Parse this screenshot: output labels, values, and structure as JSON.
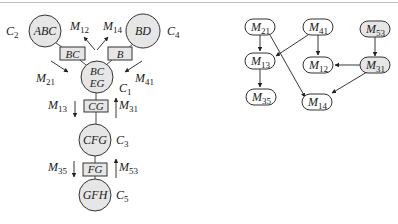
{
  "left_diagram": {
    "clusters": [
      {
        "id": "C2",
        "label": "ABC",
        "name": "C",
        "sub": "2"
      },
      {
        "id": "C4",
        "label": "BD",
        "name": "C",
        "sub": "4"
      },
      {
        "id": "C1",
        "label_line1": "BC",
        "label_line2": "EG",
        "name": "C",
        "sub": "1"
      },
      {
        "id": "C3",
        "label": "CFG",
        "name": "C",
        "sub": "3"
      },
      {
        "id": "C5",
        "label": "GFH",
        "name": "C",
        "sub": "5"
      }
    ],
    "separators": [
      {
        "id": "sep-bc",
        "label": "BC"
      },
      {
        "id": "sep-b",
        "label": "B"
      },
      {
        "id": "sep-cg",
        "label": "CG"
      },
      {
        "id": "sep-fg",
        "label": "FG"
      }
    ],
    "messages": [
      {
        "id": "M12",
        "name": "M",
        "sub": "12"
      },
      {
        "id": "M14",
        "name": "M",
        "sub": "14"
      },
      {
        "id": "M21",
        "name": "M",
        "sub": "21"
      },
      {
        "id": "M41",
        "name": "M",
        "sub": "41"
      },
      {
        "id": "M13",
        "name": "M",
        "sub": "13"
      },
      {
        "id": "M31",
        "name": "M",
        "sub": "31"
      },
      {
        "id": "M35",
        "name": "M",
        "sub": "35"
      },
      {
        "id": "M53",
        "name": "M",
        "sub": "53"
      }
    ]
  },
  "right_diagram": {
    "nodes": [
      {
        "id": "M21",
        "name": "M",
        "sub": "21"
      },
      {
        "id": "M41",
        "name": "M",
        "sub": "41"
      },
      {
        "id": "M53",
        "name": "M",
        "sub": "53"
      },
      {
        "id": "M13",
        "name": "M",
        "sub": "13"
      },
      {
        "id": "M12",
        "name": "M",
        "sub": "12"
      },
      {
        "id": "M31",
        "name": "M",
        "sub": "31"
      },
      {
        "id": "M35",
        "name": "M",
        "sub": "35"
      },
      {
        "id": "M14",
        "name": "M",
        "sub": "14"
      }
    ],
    "edges": [
      [
        "M21",
        "M13"
      ],
      [
        "M21",
        "M14"
      ],
      [
        "M41",
        "M13"
      ],
      [
        "M41",
        "M12"
      ],
      [
        "M53",
        "M31"
      ],
      [
        "M31",
        "M12"
      ],
      [
        "M31",
        "M14"
      ],
      [
        "M13",
        "M35"
      ]
    ]
  },
  "colors": {
    "node_fill": "#e6e6e6",
    "stroke": "#333333"
  }
}
